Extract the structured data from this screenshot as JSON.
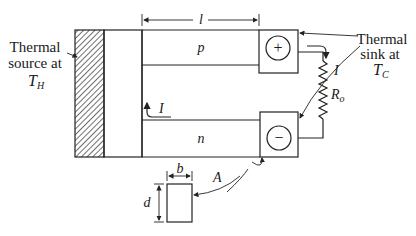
{
  "diagram": {
    "type": "thermoelectric-generator-schematic",
    "labels": {
      "source_line1": "Thermal",
      "source_line2": "source at",
      "source_temp_main": "T",
      "source_temp_sub": "H",
      "sink_line1": "Thermal",
      "sink_line2": "sink at",
      "sink_temp_main": "T",
      "sink_temp_sub": "C",
      "length": "l",
      "p_leg": "p",
      "n_leg": "n",
      "current_top": "I",
      "current_left": "I",
      "resistor_main": "R",
      "resistor_sub": "o",
      "area": "A",
      "width": "b",
      "depth": "d",
      "plus_terminal": "+",
      "minus_terminal": "−"
    },
    "colors": {
      "stroke": "#222222",
      "text": "#1a1a1a",
      "background": "#ffffff"
    }
  }
}
